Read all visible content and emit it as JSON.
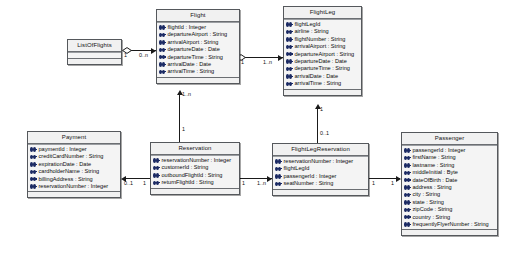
{
  "diagram": {
    "type": "uml-class-diagram",
    "colors": {
      "class_fill": "#f1f1f1",
      "class_border": "#55585c",
      "attribute_icon": "#1b2a63",
      "connector": "#1a1a1a",
      "background": "#ffffff"
    }
  },
  "classes": {
    "list_of_flights": {
      "name": "ListOfFlights",
      "attributes": []
    },
    "flight": {
      "name": "Flight",
      "attributes": [
        "flightId : Integer",
        "departureAirport : String",
        "arrivalAirport : String",
        "departureDate : Date",
        "departureTime : String",
        "arrivalDate : Date",
        "arrivalTime : String"
      ]
    },
    "flight_leg": {
      "name": "FlightLeg",
      "attributes": [
        "flightLegId",
        "airline : String",
        "flightNumber : String",
        "arrivalAirport : String",
        "departureAirport : String",
        "departureDate : Date",
        "departureTime : String",
        "arrivalDate : Date",
        "arrivalTime : String"
      ]
    },
    "payment": {
      "name": "Payment",
      "attributes": [
        "paymentId : Integer",
        "creditCardNumber : String",
        "expirationDate : Date",
        "cardholderName : String",
        "billingAddress : String",
        "reservationNumber : Integer"
      ]
    },
    "reservation": {
      "name": "Reservation",
      "attributes": [
        "reservationNumber : Integer",
        "customerId : String",
        "outboundFlightId : String",
        "returnFlightId : String"
      ]
    },
    "flight_leg_reservation": {
      "name": "FlightLegReservation",
      "attributes": [
        "reservationNumber : Integer",
        "flightLegId",
        "passengerId : Integer",
        "seatNumber : String"
      ]
    },
    "passenger": {
      "name": "Passenger",
      "attributes": [
        "passengerId : Integer",
        "firstName : String",
        "lastname : String",
        "middleInitial : Byte",
        "dateOfBirth : Date",
        "address : String",
        "city : String",
        "state : String",
        "zipCode : String",
        "country : String",
        "frequentlyFlyerNumber : String"
      ]
    }
  },
  "relationships": [
    {
      "id": "listofflights-flight",
      "from": "ListOfFlights",
      "to": "Flight",
      "from_multiplicity": "1",
      "to_multiplicity": "0..n",
      "decoration": "aggregation-diamond"
    },
    {
      "id": "flight-flightleg",
      "from": "Flight",
      "to": "FlightLeg",
      "from_multiplicity": "1",
      "to_multiplicity": "1..n",
      "decoration": "aggregation-diamond"
    },
    {
      "id": "reservation-flight",
      "from": "Reservation",
      "to": "Flight",
      "from_multiplicity": "1",
      "to_multiplicity": "1..n",
      "decoration": "arrow"
    },
    {
      "id": "reservation-payment",
      "from": "Reservation",
      "to": "Payment",
      "from_multiplicity": "1",
      "to_multiplicity": "0..1",
      "decoration": "arrow"
    },
    {
      "id": "reservation-flightlegreservation",
      "from": "Reservation",
      "to": "FlightLegReservation",
      "from_multiplicity": "1",
      "to_multiplicity": "1..n",
      "decoration": "arrow"
    },
    {
      "id": "flightlegreservation-flightleg",
      "from": "FlightLegReservation",
      "to": "FlightLeg",
      "from_multiplicity": "0..1",
      "to_multiplicity": "1",
      "decoration": "arrow"
    },
    {
      "id": "flightlegreservation-passenger",
      "from": "FlightLegReservation",
      "to": "Passenger",
      "from_multiplicity": "1",
      "to_multiplicity": "1",
      "decoration": "arrow"
    }
  ]
}
